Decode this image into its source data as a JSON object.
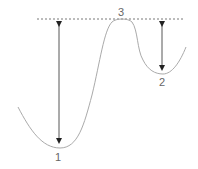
{
  "diagram": {
    "type": "potential-energy-curve",
    "colors": {
      "curve": "#aaaaaa",
      "arrow": "#333333",
      "dashed_line": "#555555",
      "label": "#666666"
    },
    "points": [
      {
        "id": "1",
        "label": "1",
        "description": "global minimum (left well)"
      },
      {
        "id": "2",
        "label": "2",
        "description": "local minimum (right well)"
      },
      {
        "id": "3",
        "label": "3",
        "description": "barrier maximum"
      }
    ],
    "arrows": [
      {
        "from": "1",
        "to": "3",
        "description": "barrier height from minimum 1"
      },
      {
        "from": "2",
        "to": "3",
        "description": "barrier height from minimum 2"
      }
    ],
    "reference_line": {
      "style": "dashed",
      "level": "maximum 3"
    }
  }
}
